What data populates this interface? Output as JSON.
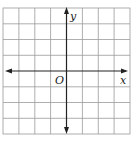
{
  "diagram": {
    "type": "coordinate-plane",
    "grid": {
      "columns": 8,
      "rows": 8,
      "line_color": "#9a9a9a"
    },
    "axes": {
      "color": "#222222",
      "x_label": "x",
      "y_label": "y",
      "origin_label": "O"
    }
  }
}
